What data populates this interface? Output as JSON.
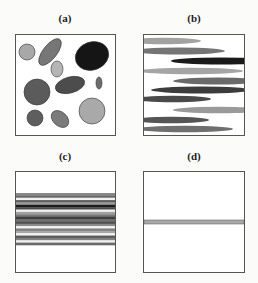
{
  "panels": [
    {
      "label": "(a)",
      "description": "randomly oriented ellipses and circles",
      "shapes": [
        {
          "type": "ellipse",
          "cx": 12,
          "cy": 18,
          "rx": 8,
          "ry": 8,
          "rot": 0,
          "fill": "#a8a8a8"
        },
        {
          "type": "ellipse",
          "cx": 35,
          "cy": 18,
          "rx": 16,
          "ry": 7,
          "rot": -52,
          "fill": "#767676"
        },
        {
          "type": "ellipse",
          "cx": 77,
          "cy": 22,
          "rx": 17,
          "ry": 14,
          "rot": -20,
          "fill": "#151515"
        },
        {
          "type": "ellipse",
          "cx": 42,
          "cy": 35,
          "rx": 6,
          "ry": 8,
          "rot": 0,
          "fill": "#b5b5b5"
        },
        {
          "type": "ellipse",
          "cx": 55,
          "cy": 51,
          "rx": 15,
          "ry": 8,
          "rot": -15,
          "fill": "#4c4c4c"
        },
        {
          "type": "ellipse",
          "cx": 84,
          "cy": 49,
          "rx": 3,
          "ry": 6,
          "rot": 0,
          "fill": "#6d6d6d"
        },
        {
          "type": "ellipse",
          "cx": 22,
          "cy": 58,
          "rx": 13,
          "ry": 13,
          "rot": 0,
          "fill": "#5b5b5b"
        },
        {
          "type": "ellipse",
          "cx": 77,
          "cy": 77,
          "rx": 13,
          "ry": 13,
          "rot": 0,
          "fill": "#a9a9a9"
        },
        {
          "type": "ellipse",
          "cx": 20,
          "cy": 84,
          "rx": 8,
          "ry": 8,
          "rot": 0,
          "fill": "#5e5e5e"
        },
        {
          "type": "ellipse",
          "cx": 45,
          "cy": 85,
          "rx": 10,
          "ry": 7,
          "rot": 42,
          "fill": "#7b7b7b"
        }
      ]
    },
    {
      "label": "(b)",
      "description": "elongated horizontal ellipses",
      "shapes": [
        {
          "cx": 20,
          "cy": 7,
          "rx": 38,
          "ry": 3.2,
          "fill": "#a2a2a2"
        },
        {
          "cx": 36,
          "cy": 17,
          "rx": 46,
          "ry": 3.4,
          "fill": "#757575"
        },
        {
          "cx": 78,
          "cy": 27,
          "rx": 50,
          "ry": 3.6,
          "fill": "#1a1a1a"
        },
        {
          "cx": 48,
          "cy": 37,
          "rx": 52,
          "ry": 3.3,
          "fill": "#a5a5a5"
        },
        {
          "cx": 75,
          "cy": 47,
          "rx": 45,
          "ry": 3.4,
          "fill": "#6a6a6a"
        },
        {
          "cx": 58,
          "cy": 56,
          "rx": 50,
          "ry": 3.5,
          "fill": "#3c3c3c"
        },
        {
          "cx": 30,
          "cy": 65,
          "rx": 38,
          "ry": 3.3,
          "fill": "#4a4a4a"
        },
        {
          "cx": 75,
          "cy": 76,
          "rx": 45,
          "ry": 3.3,
          "fill": "#9a9a9a"
        },
        {
          "cx": 28,
          "cy": 86,
          "rx": 38,
          "ry": 3.3,
          "fill": "#555555"
        },
        {
          "cx": 42,
          "cy": 95,
          "rx": 48,
          "ry": 3.3,
          "fill": "#6f6f6f"
        }
      ]
    },
    {
      "label": "(c)",
      "description": "thin horizontal lamellae stacked in middle region",
      "stripe_top": 22,
      "stripe_bottom": 74,
      "stripes": [
        "#888888",
        "#6a6a6a",
        "#f2f2f2",
        "#5e5e5e",
        "#9a9a9a",
        "#1c1c1c",
        "#4a4a4a",
        "#f0f0f0",
        "#a0a0a0",
        "#7a7a7a",
        "#3f3f3f",
        "#6e6e6e",
        "#4e4e4e",
        "#8a8a8a",
        "#f2f2f2",
        "#7e7e7e",
        "#a6a6a6",
        "#f2f2f2",
        "#5a5a5a",
        "#808080",
        "#efefef",
        "#6a6a6a"
      ]
    },
    {
      "label": "(d)",
      "description": "single thin horizontal layer",
      "band_top": 49,
      "band_height": 4,
      "band_fill": "#a8a8a8"
    }
  ],
  "colors": {
    "border": "#555555",
    "background": "#fbfbfa"
  }
}
